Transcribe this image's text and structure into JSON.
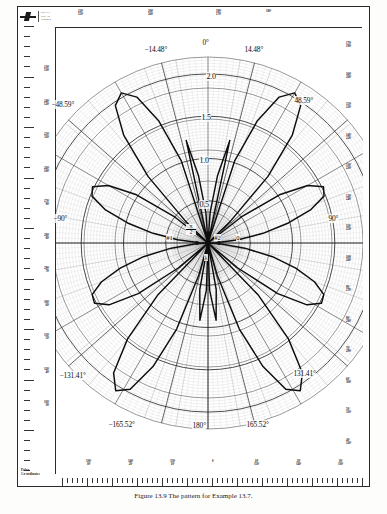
{
  "sheet": {
    "brand": "logo-mark",
    "titleblock_lines": [
      "GRAFT",
      "POLAR",
      "FORM 2"
    ],
    "polar_caption_lines": [
      "Polar",
      "Co-ordinates"
    ],
    "figure_caption": "Figure 13.9   The pattern for Example 13.7."
  },
  "chart_data": {
    "type": "line",
    "subtype": "polar-radiation-pattern",
    "grid": true,
    "angular_unit": "degrees",
    "angle_zero_at": "top",
    "radial_ticks": [
      "0.5",
      "1.0",
      "1.5",
      "2.0"
    ],
    "radial_tick_values": [
      0.5,
      1.0,
      1.5,
      2.0
    ],
    "rlim": [
      0,
      2.2
    ],
    "radial_label_angle_deg": 0,
    "null_angles_deg": [
      -14.48,
      14.48,
      -48.59,
      48.59,
      -90,
      90,
      -131.41,
      131.41,
      -165.52,
      165.52,
      180
    ],
    "null_angle_labels": [
      {
        "text": "0°",
        "deg": 0
      },
      {
        "text": "−14.48°",
        "deg": -14.48
      },
      {
        "text": "14.48°",
        "deg": 14.48
      },
      {
        "text": "−48.59°",
        "deg": -48.59
      },
      {
        "text": "48.59°",
        "deg": 48.59
      },
      {
        "text": "−90°",
        "deg": -90
      },
      {
        "text": "90°",
        "deg": 90
      },
      {
        "text": "−131.41°",
        "deg": -131.41
      },
      {
        "text": "131.41°",
        "deg": 131.41
      },
      {
        "text": "−165.52°",
        "deg": -165.52
      },
      {
        "text": "165.52°",
        "deg": 165.52
      },
      {
        "text": "180°",
        "deg": 180
      }
    ],
    "elements": [
      {
        "label": "#1",
        "x_norm": -0.13,
        "y_norm": 0.0
      },
      {
        "label": "#2",
        "x_norm": 0.13,
        "y_norm": 0.0
      }
    ],
    "element_spacing_label_num": "π",
    "element_spacing_label_den": "2",
    "phase_labels": [
      {
        "text": "0",
        "pos": "right-of-element-2"
      },
      {
        "text": "λ",
        "pos": "below-origin"
      }
    ],
    "edge_labels_top": [
      "210°\n150°",
      "200°\n160°",
      "190°\n170°",
      "180°"
    ],
    "edge_labels_right": [
      "170°\n190°",
      "160°\n200°",
      "150°\n210°",
      "140°\n220°",
      "130°\n230°",
      "120°\n240°",
      "110°\n250°",
      "100°\n260°",
      "90°\n270°",
      "80°\n280°",
      "70°\n290°",
      "60°\n300°",
      "50°\n310°",
      "40°\n320°"
    ],
    "edge_labels_left": [
      "230°\n130°",
      "240°\n120°",
      "250°\n110°",
      "260°\n100°",
      "270°\n90°",
      "280°\n80°",
      "290°\n70°",
      "300°\n60°",
      "310°\n50°",
      "320°\n40°",
      "330°\n30°"
    ],
    "edge_labels_bottom": [
      "330°\n30°",
      "340°\n20°",
      "350°\n10°",
      "0",
      "10°\n350°",
      "20°\n340°",
      "30°\n330°"
    ],
    "pattern_description": "Six-lobe array factor |cos(2.5π cosθ)| style multi-lobe pattern with nulls at the listed angles; two isotropic sources spaced λ/2 apart on the horizontal axis.",
    "pattern_points_deg_r": [
      [
        0,
        0.0
      ],
      [
        4,
        0.36
      ],
      [
        8,
        0.8
      ],
      [
        12,
        1.24
      ],
      [
        14.48,
        0.0
      ],
      [
        18,
        1.02
      ],
      [
        22,
        1.56
      ],
      [
        26,
        1.92
      ],
      [
        30,
        2.05
      ],
      [
        34,
        1.96
      ],
      [
        38,
        1.62
      ],
      [
        42,
        1.06
      ],
      [
        46,
        0.36
      ],
      [
        48.59,
        0.0
      ],
      [
        52,
        0.5
      ],
      [
        56,
        1.02
      ],
      [
        60,
        1.36
      ],
      [
        64,
        1.52
      ],
      [
        68,
        1.48
      ],
      [
        72,
        1.28
      ],
      [
        76,
        0.98
      ],
      [
        80,
        0.66
      ],
      [
        84,
        0.36
      ],
      [
        88,
        0.1
      ],
      [
        90,
        0.0
      ],
      [
        94,
        0.14
      ],
      [
        98,
        0.44
      ],
      [
        102,
        0.78
      ],
      [
        106,
        1.08
      ],
      [
        110,
        1.34
      ],
      [
        114,
        1.5
      ],
      [
        118,
        1.52
      ],
      [
        122,
        1.38
      ],
      [
        126,
        1.02
      ],
      [
        130,
        0.46
      ],
      [
        131.41,
        0.0
      ],
      [
        136,
        0.86
      ],
      [
        140,
        1.48
      ],
      [
        144,
        1.9
      ],
      [
        148,
        2.06
      ],
      [
        152,
        1.96
      ],
      [
        156,
        1.6
      ],
      [
        160,
        1.08
      ],
      [
        164,
        0.4
      ],
      [
        165.52,
        0.0
      ],
      [
        170,
        0.56
      ],
      [
        174,
        0.92
      ],
      [
        178,
        0.56
      ],
      [
        180,
        0.0
      ]
    ]
  }
}
